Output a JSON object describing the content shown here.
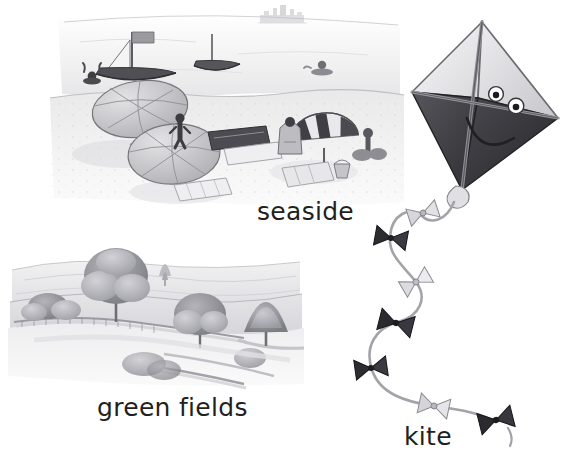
{
  "page": {
    "type": "illustrated-vocabulary-page",
    "background_color": "#ffffff",
    "width": 588,
    "height": 470,
    "ink_color": "#231f20",
    "art_style": "pencil-and-watercolour-greyscale-sketch"
  },
  "labels": {
    "seaside": "seaside",
    "green_fields": "green fields",
    "kite": "kite"
  },
  "illustrations": [
    {
      "id": "seaside-scene",
      "label": "seaside",
      "label_position": {
        "x": 257,
        "y": 199
      },
      "bounds": {
        "x": 40,
        "y": 8,
        "width": 355,
        "height": 195
      },
      "elements": [
        "distant-castle-on-horizon",
        "sailboat-large",
        "sailboat-small",
        "swimmer-in-water",
        "beach-umbrella-plain-left",
        "beach-umbrella-plain-centre",
        "beach-umbrella-striped-right",
        "beach-towels",
        "standing-figure",
        "seated-figures",
        "windbreak",
        "bucket"
      ]
    },
    {
      "id": "green-fields-scene",
      "label": "green fields",
      "label_position": {
        "x": 97,
        "y": 395
      },
      "bounds": {
        "x": 8,
        "y": 240,
        "width": 292,
        "height": 145
      },
      "elements": [
        "rolling-hills",
        "large-tree-centre",
        "tree-cluster-right",
        "hedgerow-wall",
        "winding-path",
        "distant-field-lines"
      ]
    },
    {
      "id": "kite-scene",
      "label": "kite",
      "label_position": {
        "x": 404,
        "y": 424
      },
      "bounds": {
        "x": 330,
        "y": 16,
        "width": 258,
        "height": 440
      },
      "kite_body": {
        "shape": "diamond",
        "face": {
          "eyes": 2,
          "mouth": "smile"
        },
        "upper_panels": "light-grey",
        "lower_panels": "dark-grey"
      },
      "tail": {
        "style": "wavy-string-with-bows",
        "bow_count": 8,
        "bow_colors": [
          "light",
          "dark",
          "dark",
          "light",
          "dark",
          "dark",
          "light",
          "dark"
        ]
      }
    }
  ],
  "colors": {
    "ink": "#231f20",
    "pencil_dark": "#3a3a3c",
    "pencil_mid": "#8a8a8e",
    "pencil_light": "#c9c9cc",
    "wash_light": "#e4e4e6",
    "background": "#ffffff"
  }
}
